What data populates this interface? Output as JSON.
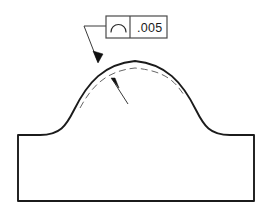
{
  "drawing": {
    "title": "Profile of a Line tolerance callout on curved surface",
    "background_color": "#ffffff",
    "line_color": "#1b1b1b",
    "thin_line_color": "#555555",
    "feature_control_frame": {
      "name": "feature-control-frame",
      "symbol": "profile-of-a-line",
      "symbol_description": "open arc",
      "tolerance_value": ".005",
      "frame": {
        "x": 106,
        "y": 16,
        "width": 61,
        "height": 22,
        "divider_x": 130
      }
    },
    "leaders": [
      {
        "name": "leader-to-actual-surface",
        "description": "Leader from feature control frame to outer solid profile",
        "points": "106,26 84,26 98,62",
        "arrow_at": {
          "x": 98,
          "y": 62
        },
        "arrow_angle_deg": 111
      },
      {
        "name": "leader-to-tolerance-zone",
        "description": "Leader from lower right to dashed tolerance boundary",
        "points": "128,104 112,79",
        "arrow_at": {
          "x": 112,
          "y": 79
        },
        "arrow_angle_deg": 237
      }
    ],
    "geometry": {
      "part_outline": {
        "name": "part-outline",
        "description": "Cross section: domed top with concave fillets and rectangular base",
        "path": "M 18,201 L 18,135 L 40,135 C 60,135 66,126 74,110 C 88,82 104,64 135,61 C 166,64 182,82 196,110 C 204,126 210,135 230,135 L 254,135 L 254,201 Z"
      },
      "tolerance_zone_dashed": {
        "name": "tolerance-zone-boundary",
        "description": "Dashed inner offset curve indicating profile tolerance zone",
        "path": "M 80,108 C 92,86 106,71 135,68 C 164,71 174,80 184,95",
        "dash_pattern": "7 4"
      }
    }
  }
}
